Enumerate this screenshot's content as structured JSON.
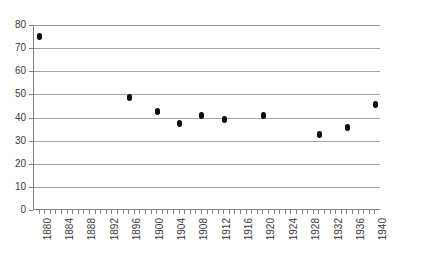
{
  "chart_data": {
    "type": "scatter",
    "title": "",
    "subtitle": "",
    "xlabel": "",
    "ylabel": "",
    "xlim": [
      1879,
      1941
    ],
    "ylim": [
      0,
      80
    ],
    "grid": true,
    "legend": null,
    "y_ticks": [
      0,
      10,
      20,
      30,
      40,
      50,
      60,
      70,
      80
    ],
    "x_ticks": [
      1880,
      1884,
      1888,
      1892,
      1896,
      1900,
      1904,
      1908,
      1912,
      1916,
      1920,
      1924,
      1928,
      1932,
      1936,
      1940
    ],
    "x_minor_tick_step": 1,
    "marker_color": "#0d0d0d",
    "gridline_color": "#a6a6a6",
    "axis_color": "#808080",
    "series": [
      {
        "name": "series-1",
        "points": [
          {
            "x": 1880,
            "y": 75.0
          },
          {
            "x": 1896,
            "y": 48.5
          },
          {
            "x": 1901,
            "y": 42.5
          },
          {
            "x": 1905,
            "y": 37.5
          },
          {
            "x": 1909,
            "y": 41.0
          },
          {
            "x": 1913,
            "y": 39.0
          },
          {
            "x": 1920,
            "y": 41.0
          },
          {
            "x": 1930,
            "y": 32.5
          },
          {
            "x": 1935,
            "y": 35.5
          },
          {
            "x": 1940,
            "y": 45.5
          }
        ]
      }
    ]
  }
}
